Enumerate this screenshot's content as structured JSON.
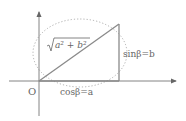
{
  "diagram": {
    "origin_label": "O",
    "hypotenuse_label_radicand": "a² + b²",
    "vertical_side_label": "sinβ=b",
    "horizontal_side_label": "cosβ=a",
    "colors": {
      "axes": "#777777",
      "triangle": "#8a8a8a",
      "circle": "#9a9a9a",
      "text": "#666666"
    }
  }
}
